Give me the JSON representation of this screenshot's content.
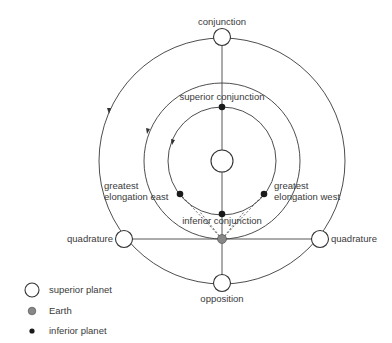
{
  "diagram": {
    "type": "planetary-configurations",
    "labels": {
      "conjunction": "conjunction",
      "superior_conjunction": "superior conjunction",
      "greatest_elongation_east_1": "greatest",
      "greatest_elongation_east_2": "elongation east",
      "greatest_elongation_west_1": "greatest",
      "greatest_elongation_west_2": "elongation west",
      "inferior_conjunction": "inferior conjunction",
      "quadrature_left": "quadrature",
      "quadrature_right": "quadrature",
      "opposition": "opposition"
    },
    "orbits": [
      {
        "name": "superior-planet-orbit",
        "radius": 123
      },
      {
        "name": "earth-orbit",
        "radius": 78
      },
      {
        "name": "inferior-planet-orbit",
        "radius": 54
      }
    ],
    "sun": {
      "name": "sun"
    },
    "colors": {
      "line": "#3a3a3a",
      "earth": "#888888",
      "inferior_planet": "#1a1a1a",
      "superior_planet_fill": "#ffffff"
    }
  },
  "legend": {
    "items": [
      {
        "symbol": "superior-planet",
        "label": "superior planet"
      },
      {
        "symbol": "earth",
        "label": "Earth"
      },
      {
        "symbol": "inferior-planet",
        "label": "inferior planet"
      }
    ]
  }
}
